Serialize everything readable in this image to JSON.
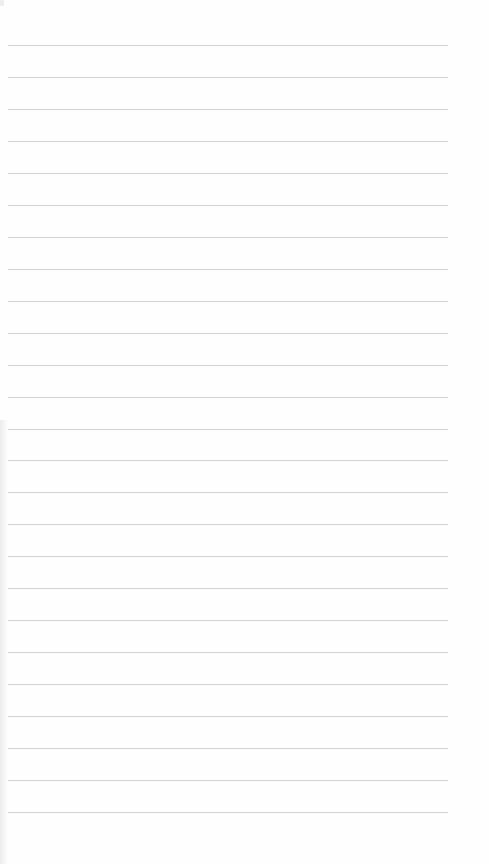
{
  "page": {
    "type": "lined-paper",
    "line_count": 25,
    "first_line_y": 45,
    "line_spacing": 31.96,
    "line_left": 8,
    "line_width": 440,
    "line_color": "#d2d2d2",
    "background_color": "#fefefe"
  }
}
